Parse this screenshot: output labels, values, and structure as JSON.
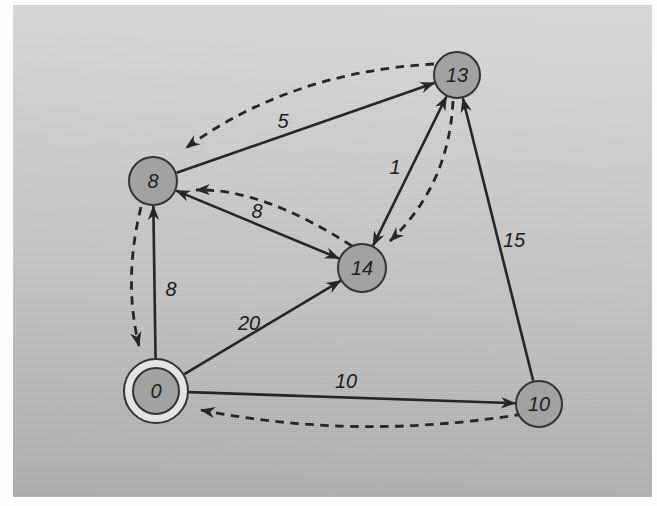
{
  "graph": {
    "type": "directed-weighted-graph",
    "style": {
      "edge_color": "#262626",
      "node_fill": "#a2a2a2",
      "node_stroke": "#333333",
      "ring_fill": "#e4e4e4",
      "scan_background_top": "#dcdcdc",
      "scan_background_bottom": "#afafaf",
      "page_background": "#fdfdfd"
    },
    "nodes": [
      {
        "id": "13",
        "label": "13",
        "x": 457,
        "y": 75,
        "r": 23
      },
      {
        "id": "8",
        "label": "8",
        "x": 153,
        "y": 181,
        "r": 24
      },
      {
        "id": "14",
        "label": "14",
        "x": 362,
        "y": 268,
        "r": 24
      },
      {
        "id": "0",
        "label": "0",
        "x": 156,
        "y": 391,
        "r": 23,
        "double_circle": true,
        "outer_r": 32
      },
      {
        "id": "10",
        "label": "10",
        "x": 539,
        "y": 404,
        "r": 23
      }
    ],
    "solid_edges": [
      {
        "from": "8",
        "to": "13",
        "weight": "5",
        "label_x": 283,
        "label_y": 128,
        "both_ends": false
      },
      {
        "from": "8",
        "to": "14",
        "weight": "8",
        "label_x": 257,
        "label_y": 218,
        "both_ends": true
      },
      {
        "from": "13",
        "to": "14",
        "weight": "1",
        "label_x": 395,
        "label_y": 174,
        "both_ends": true
      },
      {
        "from": "0",
        "to": "8",
        "weight": "8",
        "label_x": 171,
        "label_y": 296,
        "both_ends": false
      },
      {
        "from": "0",
        "to": "14",
        "weight": "20",
        "label_x": 249,
        "label_y": 330,
        "both_ends": false
      },
      {
        "from": "0",
        "to": "10",
        "weight": "10",
        "label_x": 346,
        "label_y": 388,
        "both_ends": false
      },
      {
        "from": "10",
        "to": "13",
        "weight": "15",
        "label_x": 514,
        "label_y": 247,
        "both_ends": false
      }
    ],
    "dashed_edges": [
      {
        "from": "13",
        "to": "8",
        "start": [
          434,
          64
        ],
        "ctrl": [
          290,
          72
        ],
        "end": [
          186,
          148
        ]
      },
      {
        "from": "14",
        "to": "8",
        "start": [
          352,
          246
        ],
        "ctrl": [
          262,
          188
        ],
        "end": [
          196,
          190
        ]
      },
      {
        "from": "13",
        "to": "14",
        "start": [
          453,
          101
        ],
        "ctrl": [
          449,
          185
        ],
        "end": [
          390,
          241
        ]
      },
      {
        "from": "8",
        "to": "0",
        "start": [
          141,
          207
        ],
        "ctrl": [
          123,
          280
        ],
        "end": [
          139,
          346
        ]
      },
      {
        "from": "10",
        "to": "0",
        "start": [
          523,
          414
        ],
        "ctrl": [
          358,
          441
        ],
        "end": [
          201,
          410
        ]
      }
    ]
  }
}
